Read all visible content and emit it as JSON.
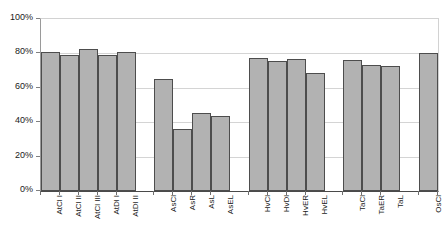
{
  "chart_data": {
    "type": "bar",
    "title": "",
    "subtitle": "",
    "xlabel": "",
    "ylabel": "",
    "ylim": [
      0,
      100
    ],
    "y_tick_labels": [
      "0%",
      "20%",
      "40%",
      "60%",
      "80%",
      "100%"
    ],
    "y_tick_values": [
      0,
      20,
      40,
      60,
      80,
      100
    ],
    "grid": true,
    "legend": "none",
    "value_suffix": "%",
    "categories": [
      "AtCl I",
      "AtCl II",
      "AtCl III",
      "AtDl I",
      "AtDl II",
      "AsCl",
      "AsR",
      "AsL",
      "AsEL",
      "HvCl",
      "HvDl",
      "HvER",
      "HvEL",
      "TaCl",
      "TaER",
      "TaL",
      "OsCl"
    ],
    "values": [
      81,
      79,
      82.5,
      79,
      81,
      65,
      36,
      45.5,
      43.5,
      77.5,
      75.5,
      77,
      68.5,
      76,
      73,
      72.5,
      80.5
    ],
    "groups": [
      {
        "name": "At",
        "categories": [
          "AtCl I",
          "AtCl II",
          "AtCl III",
          "AtDl I",
          "AtDl II"
        ]
      },
      {
        "name": "As",
        "categories": [
          "AsCl",
          "AsR",
          "AsL",
          "AsEL"
        ]
      },
      {
        "name": "Hv",
        "categories": [
          "HvCl",
          "HvDl",
          "HvER",
          "HvEL"
        ]
      },
      {
        "name": "Ta",
        "categories": [
          "TaCl",
          "TaER",
          "TaL"
        ]
      },
      {
        "name": "Os",
        "categories": [
          "OsCl"
        ]
      }
    ],
    "slot_positions": [
      0,
      1,
      2,
      3,
      4,
      6,
      7,
      8,
      9,
      11,
      12,
      13,
      14,
      16,
      17,
      18,
      20
    ],
    "total_slots": 21,
    "colors": {
      "bar_fill": "#b2b2b2",
      "bar_border": "#4d4d4d",
      "gridline": "#d4d4d4",
      "axis": "#4a4a4a",
      "text": "#1a1a1a",
      "background": "#ffffff"
    }
  }
}
